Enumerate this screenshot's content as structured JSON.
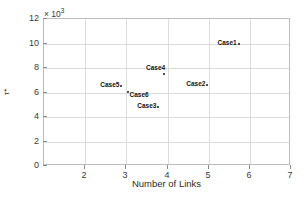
{
  "chart_data": {
    "type": "scatter",
    "title": "",
    "xlabel": "Number of Links",
    "ylabel": "τ*",
    "exponent_label": "× 10",
    "exponent_power": "3",
    "xlim": [
      1,
      7
    ],
    "ylim": [
      0,
      12
    ],
    "xticks": [
      2,
      3,
      4,
      5,
      6,
      7
    ],
    "yticks": [
      0,
      2,
      4,
      6,
      8,
      10,
      12
    ],
    "xtick_labels": [
      "2",
      "3",
      "4",
      "5",
      "6",
      "7"
    ],
    "ytick_labels": [
      "0",
      "2",
      "4",
      "6",
      "8",
      "10",
      "12"
    ],
    "grid": true,
    "legend": "none",
    "marker_color": "#1a1a1a",
    "grid_color": "#dcdcdc",
    "axis_color": "#bdbdbd",
    "points": [
      {
        "label": "Case1",
        "x": 5.73,
        "y": 9.95,
        "label_side": "left"
      },
      {
        "label": "Case2",
        "x": 4.97,
        "y": 6.58,
        "label_side": "left"
      },
      {
        "label": "Case3",
        "x": 3.78,
        "y": 4.85,
        "label_side": "left"
      },
      {
        "label": "Case4",
        "x": 3.92,
        "y": 7.5,
        "label_side": "above-left"
      },
      {
        "label": "Case5",
        "x": 2.88,
        "y": 6.52,
        "label_side": "left"
      },
      {
        "label": "Case6",
        "x": 3.03,
        "y": 6.05,
        "label_side": "right"
      }
    ]
  }
}
